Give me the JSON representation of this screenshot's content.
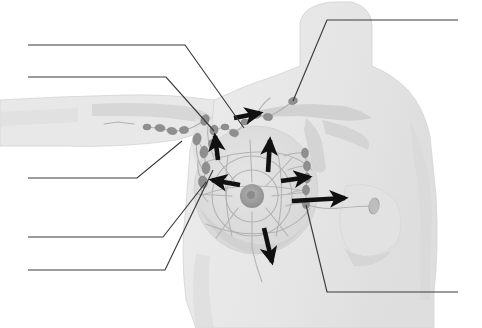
{
  "figure": {
    "background_color": "#ffffff",
    "body_fill_color": "#e9e9e9",
    "body_shade_color": "#dcdcdc",
    "body_outline_color": "#cfcfcf",
    "node_color": "#8f8f8f",
    "node_dark_color": "#7c7c7c",
    "vessel_color": "#b0b0b0",
    "areola_color": "#9c9c9c",
    "arrow_color": "#111111",
    "leader_line_color": "#3a3a3a",
    "bone_color": "#d2d2d2"
  },
  "leader_lines": [
    {
      "id": "leader-1",
      "name": "leader-line-upper-left-1",
      "blank_label": "",
      "side": "left",
      "write_on_y": 45,
      "points": "28,45 185,45 244,128"
    },
    {
      "id": "leader-2",
      "name": "leader-line-upper-left-2",
      "blank_label": "",
      "side": "left",
      "write_on_y": 77,
      "points": "28,77 166,77 214,131"
    },
    {
      "id": "leader-3",
      "name": "leader-line-middle-left",
      "blank_label": "",
      "side": "left",
      "write_on_y": 178,
      "points": "28,178 137,178 182,141"
    },
    {
      "id": "leader-4",
      "name": "leader-line-lower-left-1",
      "blank_label": "",
      "side": "left",
      "write_on_y": 237,
      "points": "28,237 163,237 206,182"
    },
    {
      "id": "leader-5",
      "name": "leader-line-lower-left-2",
      "blank_label": "",
      "side": "left",
      "write_on_y": 270,
      "points": "28,270 165,270 213,170"
    },
    {
      "id": "leader-6",
      "name": "leader-line-upper-right-supraclavicular",
      "blank_label": "",
      "side": "right",
      "write_on_y": 20,
      "points": "458,20 327,20 293,101"
    },
    {
      "id": "leader-7",
      "name": "leader-line-lower-right-internal-mammary",
      "blank_label": "",
      "side": "right",
      "write_on_y": 292,
      "points": "458,292 327,292 306,205"
    }
  ],
  "flow_arrows": [
    {
      "id": "arrow-axillary-upper",
      "name": "flow-arrow-to-axilla-upper",
      "direction": "up-right",
      "path": "234,118 260,113",
      "note": "flow toward apical axillary nodes"
    },
    {
      "id": "arrow-axillary-lateral",
      "name": "flow-arrow-lateral-up",
      "direction": "up",
      "path": "218,160 215,136",
      "note": "flow up the lateral breast to axilla"
    },
    {
      "id": "arrow-central-up",
      "name": "flow-arrow-central-up",
      "direction": "up",
      "path": "268,172 270,140",
      "note": "central breast flow superiorly"
    },
    {
      "id": "arrow-to-axilla-left",
      "name": "flow-arrow-toward-axilla",
      "direction": "left",
      "path": "240,185 212,180",
      "note": "medial-to-lateral flow toward axillary nodes"
    },
    {
      "id": "arrow-to-internal-upper",
      "name": "flow-arrow-to-internal-mammary-upper",
      "direction": "right",
      "path": "281,181 309,177",
      "note": "flow toward internal mammary chain"
    },
    {
      "id": "arrow-to-internal-lower",
      "name": "flow-arrow-to-internal-mammary-lower",
      "direction": "right",
      "path": "292,201 345,198",
      "note": "deep flow across midline to internal mammary nodes"
    },
    {
      "id": "arrow-inferior",
      "name": "flow-arrow-inferior",
      "direction": "down",
      "path": "264,228 272,262",
      "note": "inferior flow toward subdiaphragmatic route"
    }
  ],
  "lymph_nodes": {
    "supraclavicular": [
      {
        "cx": 293,
        "cy": 101,
        "rx": 4.5,
        "ry": 3.5,
        "rot": -20
      }
    ],
    "infraclavicular_axillary_apical": [
      {
        "cx": 256,
        "cy": 115,
        "rx": 5,
        "ry": 3.5,
        "rot": -10
      },
      {
        "cx": 268,
        "cy": 117,
        "rx": 4.5,
        "ry": 3.5,
        "rot": 10
      },
      {
        "cx": 245,
        "cy": 122,
        "rx": 4,
        "ry": 3,
        "rot": 0
      }
    ],
    "axillary_chain": [
      {
        "cx": 205,
        "cy": 120,
        "rx": 4,
        "ry": 5.5,
        "rot": 20
      },
      {
        "cx": 214,
        "cy": 130,
        "rx": 4,
        "ry": 5,
        "rot": 15
      },
      {
        "cx": 225,
        "cy": 127,
        "rx": 4,
        "ry": 3,
        "rot": 0
      },
      {
        "cx": 234,
        "cy": 133,
        "rx": 4.5,
        "ry": 3.5,
        "rot": 20
      },
      {
        "cx": 197,
        "cy": 139,
        "rx": 4,
        "ry": 6,
        "rot": 12
      },
      {
        "cx": 204,
        "cy": 152,
        "rx": 4,
        "ry": 6,
        "rot": 8
      },
      {
        "cx": 206,
        "cy": 168,
        "rx": 4,
        "ry": 6,
        "rot": 0
      },
      {
        "cx": 203,
        "cy": 182,
        "rx": 4.5,
        "ry": 6,
        "rot": -8
      },
      {
        "cx": 212,
        "cy": 144,
        "rx": 3.5,
        "ry": 4.5,
        "rot": 0
      }
    ],
    "lateral_arm_chain": [
      {
        "cx": 160,
        "cy": 128,
        "rx": 5,
        "ry": 3.5,
        "rot": 8
      },
      {
        "cx": 172,
        "cy": 131,
        "rx": 5,
        "ry": 3.5,
        "rot": 12
      },
      {
        "cx": 184,
        "cy": 130,
        "rx": 4.5,
        "ry": 3.5,
        "rot": -5
      },
      {
        "cx": 147,
        "cy": 127,
        "rx": 4,
        "ry": 3,
        "rot": 0
      }
    ],
    "internal_mammary_chain": [
      {
        "cx": 305,
        "cy": 153,
        "rx": 3.5,
        "ry": 5,
        "rot": 0
      },
      {
        "cx": 307,
        "cy": 166,
        "rx": 3.5,
        "ry": 5,
        "rot": 0
      },
      {
        "cx": 307,
        "cy": 178,
        "rx": 3.5,
        "ry": 5,
        "rot": 0
      },
      {
        "cx": 306,
        "cy": 190,
        "rx": 3.5,
        "ry": 5,
        "rot": 0
      },
      {
        "cx": 306,
        "cy": 204,
        "rx": 3.5,
        "ry": 4.5,
        "rot": 0
      }
    ],
    "opposite_breast": [
      {
        "cx": 374,
        "cy": 206,
        "rx": 5,
        "ry": 8,
        "rot": 10
      }
    ]
  }
}
